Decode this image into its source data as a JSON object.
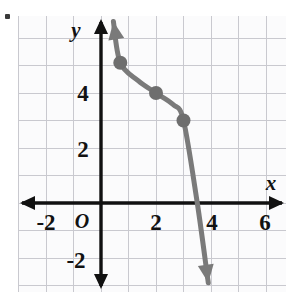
{
  "page": {
    "bullet_marker": "•"
  },
  "chart_data": {
    "type": "line",
    "title": "",
    "xlabel": "x",
    "ylabel": "y",
    "xlim": [
      -3,
      7
    ],
    "ylim": [
      -3,
      7
    ],
    "grid": true,
    "grid_step": 1,
    "legend": "none",
    "x_tick_labels": [
      "-2",
      "2",
      "4",
      "6"
    ],
    "x_tick_values": [
      -2,
      2,
      4,
      6
    ],
    "y_tick_labels": [
      "4",
      "2",
      "-2"
    ],
    "y_tick_values": [
      4,
      2,
      -2
    ],
    "origin_label": "O",
    "curve": {
      "name": "cubic-curve",
      "color": "#7a7a7a",
      "stroke_width": 5,
      "arrow_start": true,
      "arrow_end": true,
      "points": [
        [
          0.45,
          6.6
        ],
        [
          0.7,
          5.1
        ],
        [
          1.35,
          4.45
        ],
        [
          2.0,
          4.0
        ],
        [
          2.62,
          3.58
        ],
        [
          3.0,
          3.0
        ],
        [
          3.5,
          0.0
        ],
        [
          3.9,
          -2.9
        ]
      ]
    },
    "marked_points": [
      {
        "label": "point-1",
        "x": 0.7,
        "y": 5.1
      },
      {
        "label": "point-2",
        "x": 2,
        "y": 4
      },
      {
        "label": "point-3",
        "x": 3,
        "y": 3
      }
    ],
    "marker_color": "#6e6e6e",
    "marker_radius": 7,
    "axis_color": "#111111",
    "grid_color": "#c9c9cf"
  }
}
